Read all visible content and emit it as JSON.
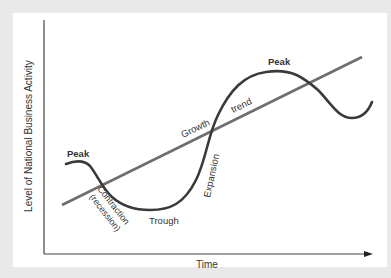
{
  "diagram": {
    "y_axis_label": "Level of National Business Activity",
    "x_axis_label": "Time",
    "trend_label_part1": "Growth",
    "trend_label_part2": "trend",
    "labels": {
      "peak_left": "Peak",
      "peak_right": "Peak",
      "contraction": "Contraction",
      "recession": "(recession)",
      "trough": "Trough",
      "expansion": "Expansion"
    },
    "colors": {
      "background": "#e9e9e9",
      "panel": "#ffffff",
      "curve": "#3a3a3a",
      "trend_line": "#6e6e6e",
      "axes": "#444444",
      "text": "#333333"
    }
  }
}
